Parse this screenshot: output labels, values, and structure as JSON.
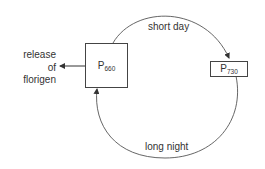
{
  "diagram": {
    "nodes": [
      {
        "id": "p660",
        "label": "P",
        "subscript": "660"
      },
      {
        "id": "p730",
        "label": "P",
        "subscript": "730"
      }
    ],
    "edges": [
      {
        "from": "p660",
        "to": "p730",
        "label": "short day"
      },
      {
        "from": "p730",
        "to": "p660",
        "label": "long night"
      },
      {
        "from": "p660",
        "to": "output",
        "label": "release of florigen"
      }
    ],
    "output_label": {
      "line1": "release",
      "line2": "of",
      "line3": "florigen"
    },
    "colors": {
      "line": "#444444",
      "text": "#333333",
      "background": "#ffffff"
    }
  }
}
